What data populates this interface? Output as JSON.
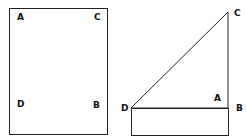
{
  "figure1": {
    "labels": {
      "A": "A",
      "C": "C",
      "D": "D",
      "B": "B"
    }
  },
  "figure2": {
    "labels": {
      "C": "C",
      "A": "A",
      "D": "D",
      "B": "B"
    }
  },
  "colors": {
    "stroke": "#222222",
    "background": "#ffffff"
  }
}
